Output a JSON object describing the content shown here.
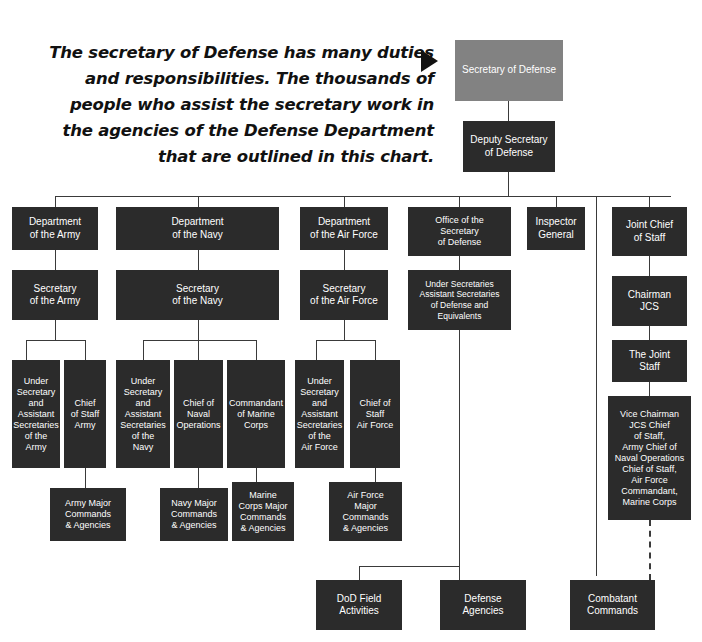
{
  "caption": {
    "text": "The secretary of Defense has many duties and responsibilities. The thousands of people who assist the secretary work in the agencies of the Defense Department that are outlined in this chart.",
    "arrow_icon": "triangle-right-icon"
  },
  "colors": {
    "box_dark": "#2b2b2b",
    "box_gray": "#828282",
    "text": "#ffffff",
    "line": "#3a3a3a",
    "background": "#ffffff"
  },
  "boxes": {
    "secretary_of_defense": "Secretary of Defense",
    "deputy_secretary_of_defense": "Deputy Secretary\nof Defense",
    "department_of_the_army": "Department\nof the Army",
    "department_of_the_navy": "Department\nof the Navy",
    "department_of_the_air_force": "Department\nof the Air Force",
    "office_of_the_secretary_of_defense": "Office of the\nSecretary\nof Defense",
    "inspector_general": "Inspector\nGeneral",
    "joint_chief_of_staff": "Joint Chief\nof Staff",
    "secretary_of_the_army": "Secretary\nof the Army",
    "secretary_of_the_navy": "Secretary\nof the Navy",
    "secretary_of_the_air_force": "Secretary\nof the Air Force",
    "under_secretaries_assistant_secretaries": "Under Secretaries\nAssistant Secretaries\nof Defense and\nEquivalents",
    "chairman_jcs": "Chairman\nJCS",
    "the_joint_staff": "The Joint\nStaff",
    "under_secretary_army": "Under\nSecretary\nand\nAssistant\nSecretaries\nof the\nArmy",
    "chief_of_staff_army": "Chief\nof Staff\nArmy",
    "under_secretary_navy": "Under\nSecretary\nand\nAssistant\nSecretaries\nof the\nNavy",
    "chief_of_naval_operations": "Chief of\nNaval\nOperations",
    "commandant_of_marine_corps": "Commandant\nof Marine\nCorps",
    "under_secretary_air_force": "Under\nSecretary\nand\nAssistant\nSecretaries\nof the\nAir Force",
    "chief_of_staff_air_force": "Chief of\nStaff\nAir Force",
    "vice_chairman_jcs": "Vice Chairman\nJCS Chief\nof Staff,\nArmy Chief of\nNaval Operations\nChief of Staff,\nAir Force\nCommandant,\nMarine Corps",
    "army_major_commands": "Army Major\nCommands\n& Agencies",
    "navy_major_commands": "Navy Major\nCommands\n& Agencies",
    "marine_corps_major_commands": "Marine\nCorps Major\nCommands\n& Agencies",
    "air_force_major_commands": "Air Force\nMajor\nCommands\n&  Agencies",
    "dod_field_activities": "DoD Field\nActivities",
    "defense_agencies": "Defense\nAgencies",
    "combatant_commands": "Combatant\nCommands"
  }
}
